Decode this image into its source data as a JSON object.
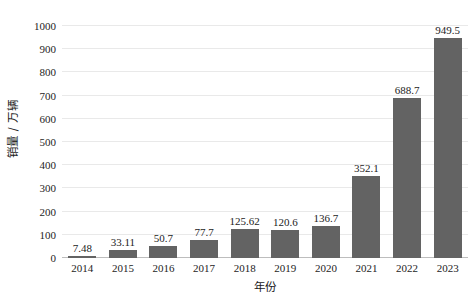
{
  "chart_data": {
    "type": "bar",
    "title": "",
    "subtitle": "",
    "xlabel": "年份",
    "ylabel": "销量 / 万辆",
    "categories": [
      "2014",
      "2015",
      "2016",
      "2017",
      "2018",
      "2019",
      "2020",
      "2021",
      "2022",
      "2023"
    ],
    "values": [
      7.48,
      33.11,
      50.7,
      77.7,
      125.62,
      120.6,
      136.7,
      352.1,
      688.7,
      949.5
    ],
    "data_labels": [
      "7.48",
      "33.11",
      "50.7",
      "77.7",
      "125.62",
      "120.6",
      "136.7",
      "352.1",
      "688.7",
      "949.5"
    ],
    "ylim": [
      0,
      1000
    ],
    "ytick_values": [
      0,
      100,
      200,
      300,
      400,
      500,
      600,
      700,
      800,
      900,
      1000
    ],
    "ytick_labels": [
      "0",
      "100",
      "200",
      "300",
      "400",
      "500",
      "600",
      "700",
      "800",
      "900",
      "1000"
    ],
    "grid": true,
    "grid_axis": "y",
    "legend": false,
    "legend_position": "none",
    "bar_color": "#636363",
    "grid_color": "#e9e9e9",
    "axis_color": "#bdbdbd",
    "text_color": "#1a1a1a",
    "background": "#ffffff"
  }
}
